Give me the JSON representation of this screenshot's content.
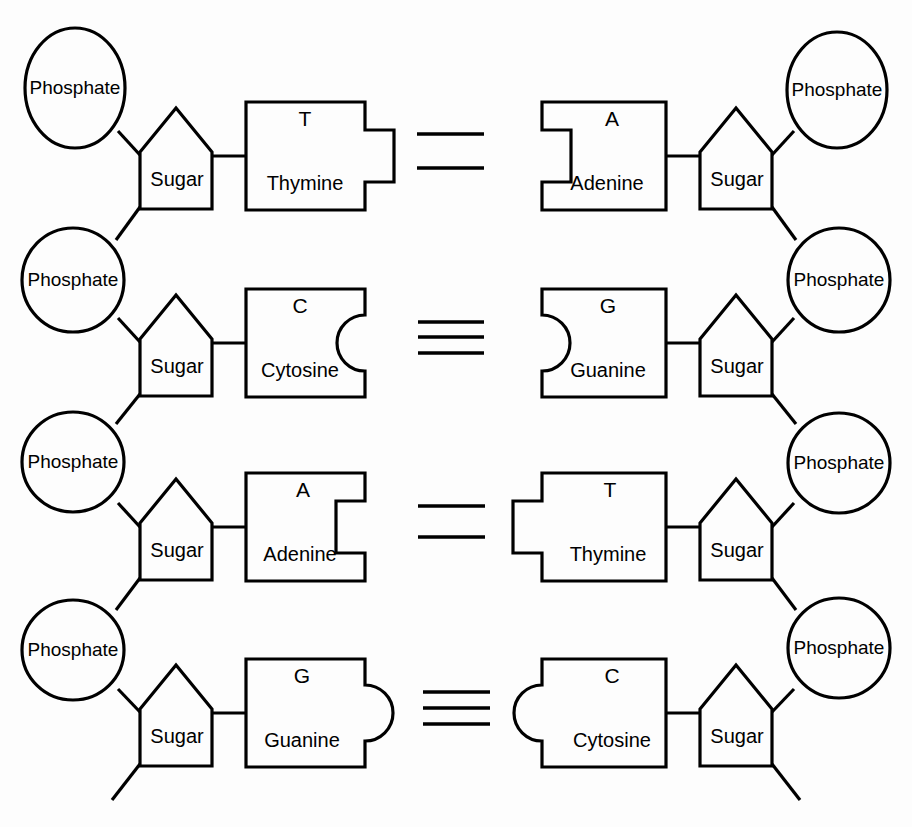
{
  "figure": {
    "background_color": "#fdfdfd",
    "stroke_color": "#000000",
    "width": 912,
    "height": 827
  },
  "labels": {
    "phosphate": "Phosphate",
    "sugar": "Sugar"
  },
  "bases": {
    "T": {
      "letter": "T",
      "name": "Thymine"
    },
    "A": {
      "letter": "A",
      "name": "Adenine"
    },
    "C": {
      "letter": "C",
      "name": "Cytosine"
    },
    "G": {
      "letter": "G",
      "name": "Guanine"
    }
  },
  "rungs": [
    {
      "index": 1,
      "left_base_letter": "T",
      "left_base_name": "Thymine",
      "right_base_letter": "A",
      "right_base_name": "Adenine",
      "hydrogen_bonds": 2,
      "connector_shape": "square",
      "left_connector": "tab",
      "right_connector": "notch"
    },
    {
      "index": 2,
      "left_base_letter": "C",
      "left_base_name": "Cytosine",
      "right_base_letter": "G",
      "right_base_name": "Guanine",
      "hydrogen_bonds": 3,
      "connector_shape": "round",
      "left_connector": "notch",
      "right_connector": "tab"
    },
    {
      "index": 3,
      "left_base_letter": "A",
      "left_base_name": "Adenine",
      "right_base_letter": "T",
      "right_base_name": "Thymine",
      "hydrogen_bonds": 2,
      "connector_shape": "square",
      "left_connector": "notch",
      "right_connector": "tab"
    },
    {
      "index": 4,
      "left_base_letter": "G",
      "left_base_name": "Guanine",
      "right_base_letter": "C",
      "right_base_name": "Cytosine",
      "hydrogen_bonds": 3,
      "connector_shape": "round",
      "left_connector": "tab",
      "right_connector": "notch"
    }
  ],
  "backbone": {
    "left_phosphate_labels": [
      "Phosphate",
      "Phosphate",
      "Phosphate",
      "Phosphate"
    ],
    "right_phosphate_labels": [
      "Phosphate",
      "Phosphate",
      "Phosphate",
      "Phosphate"
    ],
    "left_sugar_labels": [
      "Sugar",
      "Sugar",
      "Sugar",
      "Sugar"
    ],
    "right_sugar_labels": [
      "Sugar",
      "Sugar",
      "Sugar",
      "Sugar"
    ],
    "strand_tails": 2
  }
}
